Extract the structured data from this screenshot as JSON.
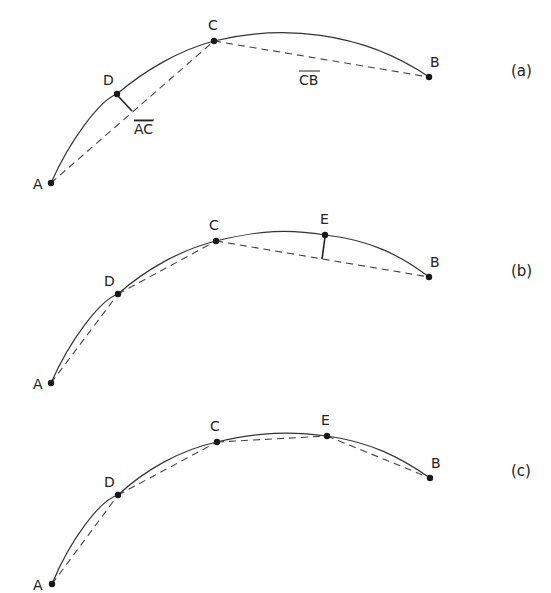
{
  "figure": {
    "panels": [
      {
        "tag": "(a)",
        "points": {
          "A": "A",
          "B": "B",
          "C": "C",
          "D": "D"
        },
        "segment_labels": {
          "AC": "AC",
          "CB": "CB"
        }
      },
      {
        "tag": "(b)",
        "points": {
          "A": "A",
          "B": "B",
          "C": "C",
          "D": "D",
          "E": "E"
        }
      },
      {
        "tag": "(c)",
        "points": {
          "A": "A",
          "B": "B",
          "C": "C",
          "D": "D",
          "E": "E"
        }
      }
    ]
  }
}
